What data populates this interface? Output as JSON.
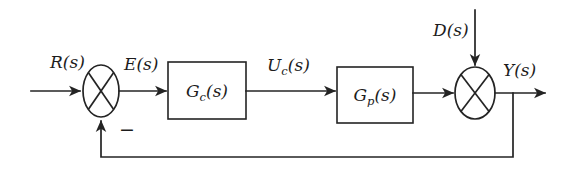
{
  "diagram": {
    "type": "control-block-diagram",
    "background_color": "#ffffff",
    "line_color": "#242424",
    "text_color": "#1c1c1c",
    "width": 570,
    "height": 175
  },
  "labels": {
    "reference_input": "R(s)",
    "error_signal": "E(s)",
    "control_signal_base": "U",
    "control_signal_sub": "c",
    "control_signal_tail": "(s)",
    "disturbance_input": "D(s)",
    "output_signal": "Y(s)",
    "feedback_sign": "−"
  },
  "blocks": [
    {
      "id": "controller",
      "base": "G",
      "subscript": "c",
      "tail": "(s)",
      "full_label": "G_c(s)",
      "x": 168,
      "y": 62,
      "width": 78,
      "height": 57
    },
    {
      "id": "plant",
      "base": "G",
      "subscript": "p",
      "tail": "(s)",
      "full_label": "G_p(s)",
      "x": 337,
      "y": 67,
      "width": 76,
      "height": 56
    }
  ],
  "summing_junctions": [
    {
      "id": "error-junction",
      "cx": 101,
      "cy": 91,
      "rx": 18,
      "ry": 26,
      "inputs": [
        "R(s) from left",
        "feedback from below (negative)"
      ],
      "output": "E(s) to the right",
      "sign_marker": "−"
    },
    {
      "id": "disturbance-junction",
      "cx": 475,
      "cy": 93,
      "rx": 20,
      "ry": 26,
      "inputs": [
        "plant output from left",
        "D(s) from above"
      ],
      "output": "Y(s) to the right",
      "sign_marker": ""
    }
  ],
  "signals": [
    {
      "name": "R(s)",
      "from": "external-left",
      "to": "error-junction"
    },
    {
      "name": "E(s)",
      "from": "error-junction",
      "to": "controller"
    },
    {
      "name": "U_c(s)",
      "from": "controller",
      "to": "plant"
    },
    {
      "name": "D(s)",
      "from": "external-top",
      "to": "disturbance-junction"
    },
    {
      "name": "Y(s)",
      "from": "disturbance-junction",
      "to": "external-right"
    },
    {
      "name": "feedback",
      "from": "Y(s) tap",
      "to": "error-junction"
    }
  ],
  "feedback_path": {
    "tap_x": 513,
    "bottom_y": 157,
    "return_x": 101,
    "sign": "negative"
  }
}
